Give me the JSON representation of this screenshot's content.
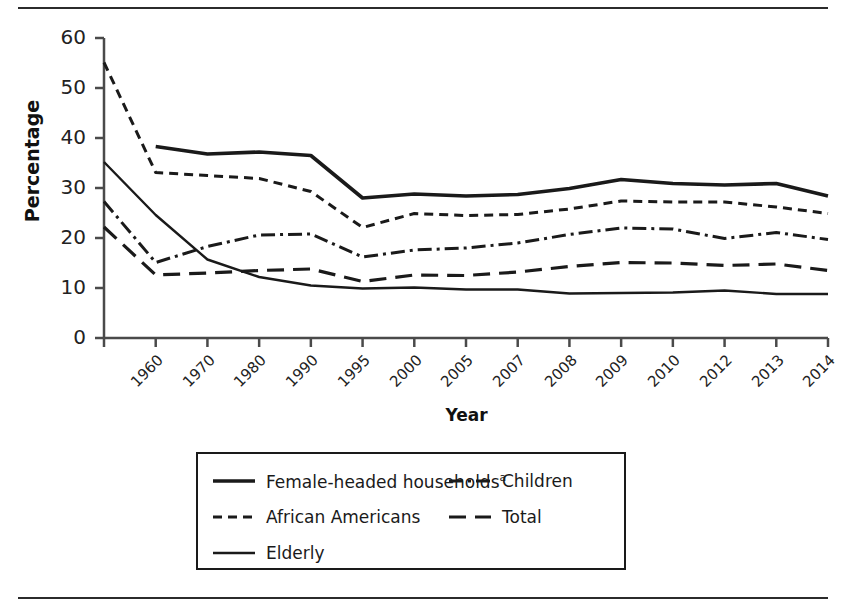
{
  "figure": {
    "y_axis_title": "Percentage",
    "x_axis_title": "Year"
  },
  "legend": {
    "entries": [
      {
        "label": "Female-headed households",
        "superscript": "a",
        "style": "solid-thick",
        "column": 0,
        "row": 0
      },
      {
        "label": "African Americans",
        "superscript": "",
        "style": "dashed",
        "column": 0,
        "row": 1
      },
      {
        "label": "Elderly",
        "superscript": "",
        "style": "solid-thin",
        "column": 0,
        "row": 2
      },
      {
        "label": "Children",
        "superscript": "",
        "style": "dash-dot",
        "column": 1,
        "row": 0
      },
      {
        "label": "Total",
        "superscript": "",
        "style": "long-dash",
        "column": 1,
        "row": 1
      }
    ]
  },
  "colors": {
    "line": "#1a1a1a",
    "axis": "#4a4a4a",
    "background": "#ffffff",
    "rule": "#2b2b2b"
  },
  "chart_data": {
    "type": "line",
    "title": "",
    "xlabel": "Year",
    "ylabel": "Percentage",
    "ylim": [
      0,
      60
    ],
    "yticks": [
      0,
      10,
      20,
      30,
      40,
      50,
      60
    ],
    "grid": false,
    "legend_position": "below-plot",
    "categories": [
      "1960",
      "1970",
      "1980",
      "1990",
      "1995",
      "2000",
      "2005",
      "2007",
      "2008",
      "2009",
      "2010",
      "2012",
      "2013",
      "2014",
      "2015"
    ],
    "series": [
      {
        "name": "Female-headed households",
        "style": "solid-thick",
        "values": [
          null,
          38.3,
          36.8,
          37.2,
          36.5,
          28.0,
          28.8,
          28.4,
          28.7,
          29.9,
          31.7,
          30.9,
          30.6,
          30.9,
          28.4
        ]
      },
      {
        "name": "African Americans",
        "style": "dashed",
        "values": [
          55.1,
          33.1,
          32.5,
          31.9,
          29.3,
          22.1,
          24.9,
          24.5,
          24.7,
          25.8,
          27.4,
          27.2,
          27.2,
          26.2,
          24.9
        ]
      },
      {
        "name": "Children",
        "style": "dash-dot",
        "values": [
          27.3,
          15.1,
          18.3,
          20.6,
          20.8,
          16.2,
          17.6,
          18.0,
          19.0,
          20.7,
          22.0,
          21.8,
          19.9,
          21.1,
          19.7
        ]
      },
      {
        "name": "Total",
        "style": "long-dash",
        "values": [
          22.2,
          12.6,
          13.0,
          13.5,
          13.8,
          11.3,
          12.6,
          12.5,
          13.2,
          14.3,
          15.1,
          15.0,
          14.5,
          14.8,
          13.5
        ]
      },
      {
        "name": "Elderly",
        "style": "solid-thin",
        "values": [
          35.2,
          24.6,
          15.7,
          12.2,
          10.5,
          9.9,
          10.1,
          9.7,
          9.7,
          8.9,
          9.0,
          9.1,
          9.5,
          8.8,
          8.8
        ]
      }
    ]
  }
}
